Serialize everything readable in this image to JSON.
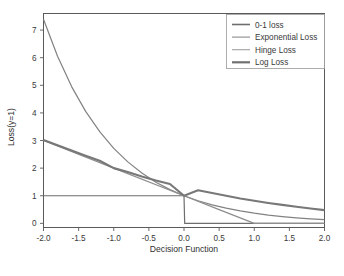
{
  "figure": {
    "background_color": "#ffffff",
    "frame_color": "#5a5a5a"
  },
  "chart_data": {
    "type": "line",
    "title": "",
    "xlabel": "Decision Function",
    "ylabel": "Loss(y=1)",
    "xlim": [
      -2.0,
      2.0
    ],
    "ylim": [
      -0.15,
      7.6
    ],
    "xticks": [
      -2.0,
      -1.5,
      -1.0,
      -0.5,
      0.0,
      0.5,
      1.0,
      1.5,
      2.0
    ],
    "xtick_labels": [
      "-2.0",
      "-1.5",
      "-1.0",
      "-0.5",
      "0.0",
      "0.5",
      "1.0",
      "1.5",
      "2.0"
    ],
    "yticks": [
      0,
      1,
      2,
      3,
      4,
      5,
      6,
      7
    ],
    "ytick_labels": [
      "0",
      "1",
      "2",
      "3",
      "4",
      "5",
      "6",
      "7"
    ],
    "grid": false,
    "legend_position": "upper right",
    "series": [
      {
        "name": "0-1 loss",
        "color": "#6e6e6e",
        "linewidth": 1.2,
        "x": [
          -2.0,
          -1.5,
          -1.0,
          -0.5,
          -0.01,
          0.0,
          0.01,
          0.5,
          1.0,
          1.5,
          2.0
        ],
        "y": [
          1.0,
          1.0,
          1.0,
          1.0,
          1.0,
          1.0,
          0.0,
          0.0,
          0.0,
          0.0,
          0.0
        ]
      },
      {
        "name": "Exponential Loss",
        "color": "#828282",
        "linewidth": 1.2,
        "x": [
          -2.0,
          -1.8,
          -1.6,
          -1.4,
          -1.2,
          -1.0,
          -0.8,
          -0.6,
          -0.4,
          -0.2,
          0.0,
          0.2,
          0.4,
          0.6,
          0.8,
          1.0,
          1.2,
          1.4,
          1.6,
          1.8,
          2.0
        ],
        "y": [
          7.389,
          6.05,
          4.953,
          4.055,
          3.32,
          2.718,
          2.226,
          1.822,
          1.492,
          1.221,
          1.0,
          0.819,
          0.67,
          0.549,
          0.449,
          0.368,
          0.301,
          0.247,
          0.202,
          0.165,
          0.135
        ]
      },
      {
        "name": "Hinge Loss",
        "color": "#8e8e8e",
        "linewidth": 1.3,
        "x": [
          -2.0,
          -1.0,
          0.0,
          0.5,
          1.0,
          1.5,
          2.0
        ],
        "y": [
          3.0,
          2.0,
          1.0,
          0.5,
          0.0,
          0.0,
          0.0
        ]
      },
      {
        "name": "Log Loss",
        "color": "#787878",
        "linewidth": 2.1,
        "x": [
          -2.0,
          -1.8,
          -1.6,
          -1.4,
          -1.2,
          -1.0,
          -0.8,
          -0.6,
          -0.4,
          -0.2,
          0.0,
          0.2,
          0.4,
          0.6,
          0.8,
          1.0,
          1.2,
          1.4,
          1.6,
          1.8,
          2.0
        ],
        "y": [
          3.018,
          2.825,
          2.635,
          2.449,
          2.269,
          2.0,
          1.856,
          1.697,
          1.553,
          1.424,
          1.0,
          1.2,
          1.1,
          1.0,
          0.9,
          0.82,
          0.74,
          0.67,
          0.6,
          0.54,
          0.48
        ]
      }
    ]
  },
  "legend": {
    "entries": [
      {
        "label": "0-1 loss",
        "color": "#6e6e6e",
        "linewidth": 1.6
      },
      {
        "label": "Exponential Loss",
        "color": "#8c8c8c",
        "linewidth": 1.1
      },
      {
        "label": "Hinge Loss",
        "color": "#a0a0a0",
        "linewidth": 1.1
      },
      {
        "label": "Log Loss",
        "color": "#707070",
        "linewidth": 2.2
      }
    ]
  }
}
